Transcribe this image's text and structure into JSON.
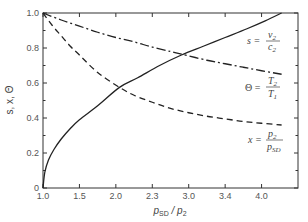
{
  "chart_data": {
    "type": "line",
    "title": "",
    "xlabel": "p_SD / p_2",
    "ylabel": "s, x, Θ",
    "x_tick_labels": [
      "1.0",
      "1.5",
      "2.0",
      "2.3",
      "3.0",
      "3.4",
      "4.0"
    ],
    "x_tick_positions": [
      0,
      1,
      2,
      3,
      4,
      5,
      6
    ],
    "x_range_positions": [
      0,
      7
    ],
    "y_tick_labels": [
      "0",
      "0.2",
      "0.4",
      "0.6",
      "0.8",
      "1.0"
    ],
    "y_ticks": [
      0,
      0.2,
      0.4,
      0.6,
      0.8,
      1.0
    ],
    "ylim": [
      0,
      1.0
    ],
    "grid": false,
    "legend": "inline labels at right",
    "series": [
      {
        "name": "s = v2 / c2",
        "style": "solid",
        "x": [
          0,
          0.05,
          0.15,
          0.3,
          0.5,
          0.75,
          1.0,
          1.5,
          2.1,
          2.6,
          3.2,
          3.8,
          4.4,
          5.0,
          5.6,
          6.1,
          6.55
        ],
        "values": [
          0,
          0.09,
          0.16,
          0.22,
          0.28,
          0.34,
          0.39,
          0.47,
          0.575,
          0.63,
          0.7,
          0.76,
          0.81,
          0.86,
          0.91,
          0.955,
          1.0
        ]
      },
      {
        "name": "Θ = T2 / T1",
        "style": "dash-dot",
        "x": [
          0,
          0.5,
          1.0,
          1.5,
          2.0,
          2.5,
          3.0,
          3.5,
          3.8,
          4.5,
          5.0,
          5.5,
          6.0,
          6.55
        ],
        "values": [
          1.0,
          0.96,
          0.925,
          0.89,
          0.86,
          0.835,
          0.805,
          0.78,
          0.765,
          0.73,
          0.71,
          0.69,
          0.67,
          0.65
        ]
      },
      {
        "name": "x = p2 / p_SD",
        "style": "dashed",
        "x": [
          0,
          0.25,
          0.5,
          0.75,
          1.0,
          1.5,
          2.1,
          2.5,
          3.0,
          3.5,
          4.0,
          4.5,
          5.0,
          5.5,
          6.0,
          6.55
        ],
        "values": [
          1.0,
          0.93,
          0.87,
          0.81,
          0.76,
          0.66,
          0.575,
          0.53,
          0.49,
          0.455,
          0.43,
          0.41,
          0.395,
          0.38,
          0.37,
          0.36
        ]
      }
    ],
    "annotations": [
      {
        "text": "s = v2 / c2",
        "near_series": "s"
      },
      {
        "text": "Θ = T2 / T1",
        "near_series": "Θ"
      },
      {
        "text": "x = p2 / p_SD",
        "near_series": "x"
      }
    ]
  },
  "labels": {
    "ylabel": "s, x, Θ",
    "xlabel_main": "p",
    "xlabel_sub1": "SD",
    "xlabel_sep": " / ",
    "xlabel_main2": "p",
    "xlabel_sub2": "2",
    "s_lhs": "s =",
    "s_num": "v",
    "s_num_sub": "2",
    "s_den": "c",
    "s_den_sub": "2",
    "theta_lhs": "Θ =",
    "theta_num": "T",
    "theta_num_sub": "2",
    "theta_den": "T",
    "theta_den_sub": "1",
    "x_lhs": "x =",
    "x_num": "p",
    "x_num_sub": "2",
    "x_den": "p",
    "x_den_sub": "SD"
  },
  "colors": {
    "line": "#222222",
    "axis": "#333333",
    "text": "#555555"
  }
}
